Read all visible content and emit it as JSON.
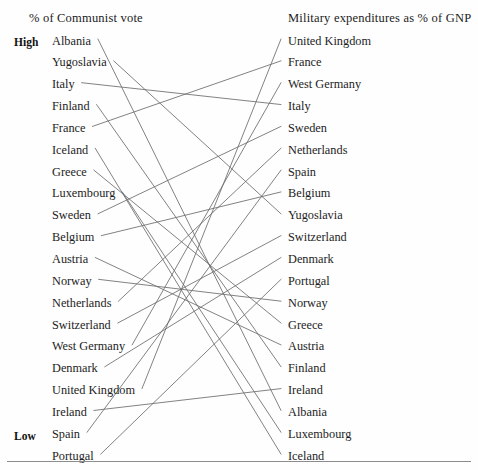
{
  "figure": {
    "type": "slopegraph",
    "background_color": "#fefefe",
    "line_color": "#6b6b6b",
    "text_color": "#1b1b1b"
  },
  "headers": {
    "left": "% of Communist vote",
    "right": "Military expenditures as % of GNP"
  },
  "axis": {
    "high": "High",
    "low": "Low"
  },
  "chart_data": {
    "type": "slopegraph",
    "title": "",
    "xlabel": "",
    "ylabel": "",
    "grid": false,
    "legend": "none",
    "axes": [
      {
        "name": "left",
        "label": "% of Communist vote",
        "top_label": "High",
        "bottom_label": "Low"
      },
      {
        "name": "right",
        "label": "Military expenditures as % of GNP",
        "top_label": "",
        "bottom_label": ""
      }
    ],
    "note": "Both columns are rank orderings (high at top, low at bottom); a line links each country's rank on the left axis to its rank on the right axis.",
    "left_order": [
      "Albania",
      "Yugoslavia",
      "Italy",
      "Finland",
      "France",
      "Iceland",
      "Greece",
      "Luxembourg",
      "Sweden",
      "Belgium",
      "Austria",
      "Norway",
      "Netherlands",
      "Switzerland",
      "West Germany",
      "Denmark",
      "United Kingdom",
      "Ireland",
      "Spain",
      "Portugal"
    ],
    "right_order": [
      "United Kingdom",
      "France",
      "West Germany",
      "Italy",
      "Sweden",
      "Netherlands",
      "Spain",
      "Belgium",
      "Yugoslavia",
      "Switzerland",
      "Denmark",
      "Portugal",
      "Norway",
      "Greece",
      "Austria",
      "Finland",
      "Ireland",
      "Albania",
      "Luxembourg",
      "Iceland"
    ],
    "pairs": [
      {
        "label": "Albania",
        "left_rank": 1,
        "right_rank": 18
      },
      {
        "label": "Yugoslavia",
        "left_rank": 2,
        "right_rank": 9
      },
      {
        "label": "Italy",
        "left_rank": 3,
        "right_rank": 4
      },
      {
        "label": "Finland",
        "left_rank": 4,
        "right_rank": 16
      },
      {
        "label": "France",
        "left_rank": 5,
        "right_rank": 2
      },
      {
        "label": "Iceland",
        "left_rank": 6,
        "right_rank": 20
      },
      {
        "label": "Greece",
        "left_rank": 7,
        "right_rank": 14
      },
      {
        "label": "Luxembourg",
        "left_rank": 8,
        "right_rank": 19
      },
      {
        "label": "Sweden",
        "left_rank": 9,
        "right_rank": 5
      },
      {
        "label": "Belgium",
        "left_rank": 10,
        "right_rank": 8
      },
      {
        "label": "Austria",
        "left_rank": 11,
        "right_rank": 15
      },
      {
        "label": "Norway",
        "left_rank": 12,
        "right_rank": 13
      },
      {
        "label": "Netherlands",
        "left_rank": 13,
        "right_rank": 6
      },
      {
        "label": "Switzerland",
        "left_rank": 14,
        "right_rank": 10
      },
      {
        "label": "West Germany",
        "left_rank": 15,
        "right_rank": 3
      },
      {
        "label": "Denmark",
        "left_rank": 16,
        "right_rank": 11
      },
      {
        "label": "United Kingdom",
        "left_rank": 17,
        "right_rank": 1
      },
      {
        "label": "Ireland",
        "left_rank": 18,
        "right_rank": 17
      },
      {
        "label": "Spain",
        "left_rank": 19,
        "right_rank": 7
      },
      {
        "label": "Portugal",
        "left_rank": 20,
        "right_rank": 12
      }
    ]
  }
}
